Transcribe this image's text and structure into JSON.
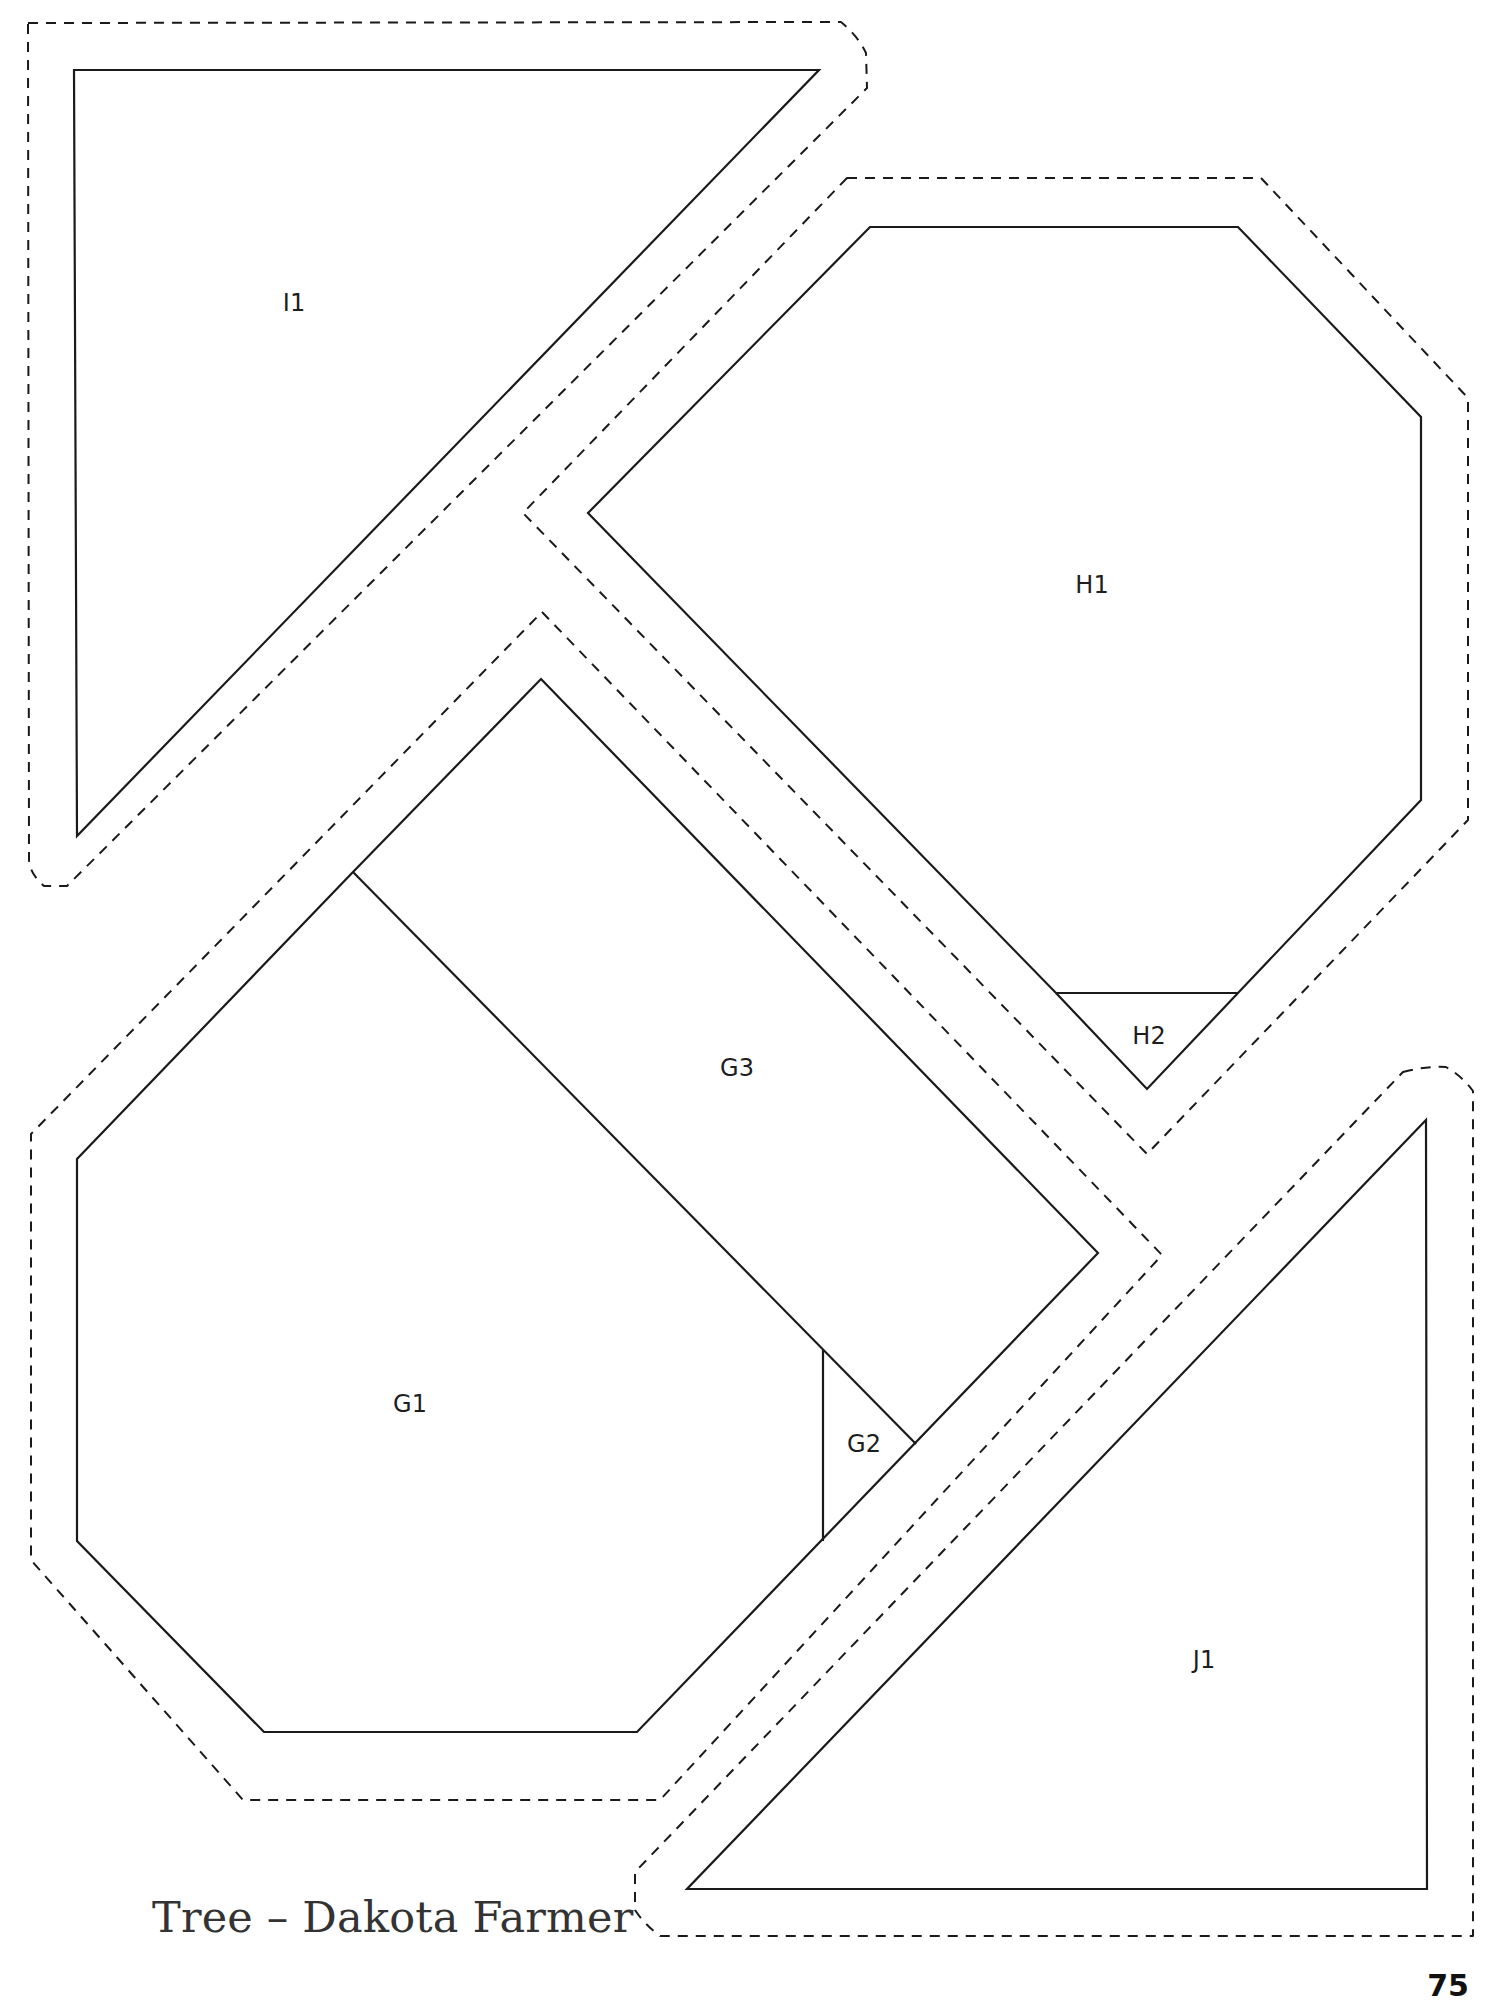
{
  "page": {
    "caption": "Tree – Dakota Farmer",
    "page_number": "75"
  },
  "pattern": {
    "pieces": [
      {
        "id": "I1",
        "label": "I1",
        "label_pos": [
          294,
          303
        ]
      },
      {
        "id": "H1",
        "label": "H1",
        "label_pos": [
          1092,
          585
        ]
      },
      {
        "id": "H2",
        "label": "H2",
        "label_pos": [
          1149,
          1036
        ]
      },
      {
        "id": "G3",
        "label": "G3",
        "label_pos": [
          737,
          1068
        ]
      },
      {
        "id": "G1",
        "label": "G1",
        "label_pos": [
          410,
          1404
        ]
      },
      {
        "id": "G2",
        "label": "G2",
        "label_pos": [
          864,
          1444
        ]
      },
      {
        "id": "J1",
        "label": "J1",
        "label_pos": [
          1204,
          1660
        ]
      }
    ],
    "colors": {
      "line": "#1a1a1a",
      "background": "#ffffff"
    }
  }
}
